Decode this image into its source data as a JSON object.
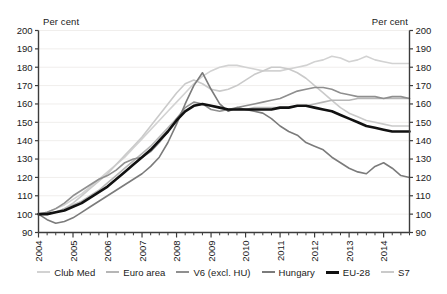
{
  "chart_data": {
    "type": "line",
    "title": "",
    "xlabel": "",
    "ylabel": "Per cent",
    "ylabel_right": "Per cent",
    "ylim": [
      90,
      200
    ],
    "ytick_step": 10,
    "yticks": [
      90,
      100,
      110,
      120,
      130,
      140,
      150,
      160,
      170,
      180,
      190,
      200
    ],
    "categories": [
      "2004 Q1",
      "2004 Q2",
      "2004 Q3",
      "2004 Q4",
      "2005 Q1",
      "2005 Q2",
      "2005 Q3",
      "2005 Q4",
      "2006 Q1",
      "2006 Q2",
      "2006 Q3",
      "2006 Q4",
      "2007 Q1",
      "2007 Q2",
      "2007 Q3",
      "2007 Q4",
      "2008 Q1",
      "2008 Q2",
      "2008 Q3",
      "2008 Q4",
      "2009 Q1",
      "2009 Q2",
      "2009 Q3",
      "2009 Q4",
      "2010 Q1",
      "2010 Q2",
      "2010 Q3",
      "2010 Q4",
      "2011 Q1",
      "2011 Q2",
      "2011 Q3",
      "2011 Q4",
      "2012 Q1",
      "2012 Q2",
      "2012 Q3",
      "2012 Q4",
      "2013 Q1",
      "2013 Q2",
      "2013 Q3",
      "2013 Q4",
      "2014 Q1",
      "2014 Q2",
      "2014 Q3",
      "2014 Q4"
    ],
    "year_ticks": [
      "2004",
      "2005",
      "2006",
      "2007",
      "2008",
      "2009",
      "2010",
      "2011",
      "2012",
      "2013",
      "2014"
    ],
    "grid": true,
    "grid_axis": "y",
    "legend_position": "bottom",
    "series": [
      {
        "name": "Club Med",
        "color": "#d2d2d2",
        "width": 1.6,
        "values": [
          100,
          101,
          103,
          105,
          108,
          111,
          115,
          119,
          123,
          127,
          131,
          136,
          141,
          146,
          151,
          156,
          161,
          166,
          171,
          175,
          178,
          180,
          181,
          181,
          180,
          179,
          178,
          178,
          178,
          179,
          180,
          181,
          183,
          184,
          186,
          185,
          183,
          184,
          186,
          184,
          183,
          182,
          182,
          182
        ]
      },
      {
        "name": "Euro area",
        "color": "#b6b6b6",
        "width": 1.6,
        "values": [
          100,
          100,
          101,
          103,
          105,
          107,
          110,
          113,
          117,
          121,
          125,
          129,
          133,
          137,
          142,
          147,
          152,
          156,
          159,
          160,
          159,
          158,
          157,
          157,
          157,
          158,
          158,
          158,
          158,
          158,
          159,
          159,
          160,
          161,
          162,
          162,
          162,
          163,
          163,
          163,
          163,
          163,
          163,
          163
        ]
      },
      {
        "name": "V6 (excl. HU)",
        "color": "#8f8f8f",
        "width": 1.6,
        "values": [
          100,
          101,
          103,
          106,
          110,
          113,
          116,
          119,
          121,
          124,
          128,
          130,
          131,
          134,
          139,
          145,
          152,
          158,
          161,
          160,
          157,
          156,
          157,
          158,
          159,
          160,
          161,
          162,
          163,
          165,
          167,
          168,
          169,
          169,
          168,
          166,
          165,
          164,
          164,
          164,
          163,
          164,
          164,
          163
        ]
      },
      {
        "name": "Hungary",
        "color": "#7b7b7b",
        "width": 1.6,
        "values": [
          100,
          97,
          95,
          96,
          98,
          101,
          104,
          107,
          110,
          113,
          116,
          119,
          122,
          126,
          131,
          139,
          149,
          160,
          170,
          177,
          168,
          160,
          156,
          158,
          157,
          156,
          155,
          152,
          148,
          145,
          143,
          139,
          137,
          135,
          131,
          128,
          125,
          123,
          122,
          126,
          128,
          125,
          121,
          120
        ]
      },
      {
        "name": "EU-28",
        "color": "#111111",
        "width": 2.6,
        "values": [
          100,
          100,
          101,
          102,
          104,
          106,
          109,
          112,
          115,
          119,
          123,
          127,
          131,
          135,
          140,
          145,
          151,
          156,
          159,
          160,
          159,
          158,
          157,
          157,
          157,
          157,
          157,
          157,
          158,
          158,
          159,
          159,
          158,
          157,
          156,
          154,
          152,
          150,
          148,
          147,
          146,
          145,
          145,
          145
        ]
      },
      {
        "name": "S7",
        "color": "#cacaca",
        "width": 1.6,
        "values": [
          100,
          100,
          101,
          103,
          106,
          110,
          114,
          118,
          122,
          127,
          132,
          137,
          142,
          148,
          154,
          160,
          166,
          171,
          173,
          171,
          168,
          167,
          168,
          170,
          173,
          176,
          178,
          180,
          180,
          179,
          177,
          174,
          170,
          166,
          162,
          158,
          155,
          153,
          151,
          150,
          149,
          148,
          148,
          148
        ]
      }
    ]
  }
}
